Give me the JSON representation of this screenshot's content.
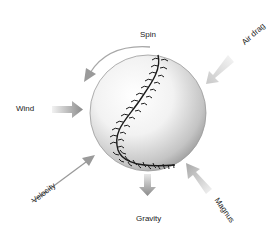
{
  "diagram": {
    "title": "",
    "colors": {
      "ball_light": "#ffffff",
      "ball_shadow": "#8a8a8a",
      "stitch": "#1a1a1a",
      "arrow": "#9a9a9a",
      "arrow_light": "#dddddd",
      "text": "#222222"
    },
    "forces": [
      {
        "id": "spin",
        "label": "Spin",
        "icon": "curved-arrow-icon"
      },
      {
        "id": "air-drag",
        "label": "Air drag",
        "icon": "arrow-icon"
      },
      {
        "id": "wind",
        "label": "Wind",
        "icon": "arrow-icon"
      },
      {
        "id": "velocity",
        "label": "Velocity",
        "icon": "line-arrow-icon"
      },
      {
        "id": "gravity",
        "label": "Gravity",
        "icon": "arrow-icon"
      },
      {
        "id": "magnus",
        "label": "Magnus",
        "icon": "arrow-icon"
      }
    ]
  }
}
